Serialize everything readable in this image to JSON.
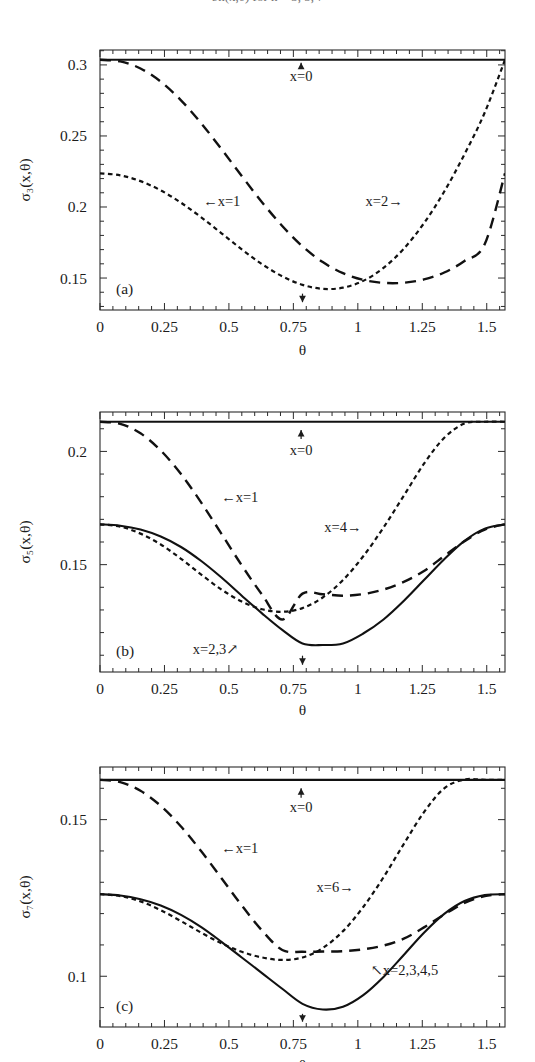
{
  "figure": {
    "partial_top_text": "σn(x,θ) for n = 3, 5, 7",
    "panel_count": 3
  },
  "panels": [
    {
      "tag": "(a)",
      "ylabel": "σ₃(x,θ)",
      "xlabel": "θ",
      "yticks": [
        "0.15",
        "0.2",
        "0.25",
        "0.3"
      ],
      "ytick_values": [
        0.15,
        0.2,
        0.25,
        0.3
      ],
      "xticks": [
        "0",
        "0.25",
        "0.5",
        "0.75",
        "1",
        "1.25",
        "1.5"
      ],
      "xtick_values": [
        0,
        0.25,
        0.5,
        0.75,
        1,
        1.25,
        1.5
      ],
      "annotations": [
        {
          "name": "x-zero-label",
          "text": "x=0",
          "arrow": "up"
        },
        {
          "name": "x-one-label",
          "text": "←x=1",
          "arrow": "none"
        },
        {
          "name": "x-two-label",
          "text": "x=2→",
          "arrow": "none"
        },
        {
          "name": "minimum-marker",
          "text": "",
          "arrow": "down"
        }
      ]
    },
    {
      "tag": "(b)",
      "ylabel": "σ₅(x,θ)",
      "xlabel": "θ",
      "yticks": [
        "0.15",
        "0.2"
      ],
      "ytick_values": [
        0.15,
        0.2
      ],
      "xticks": [
        "0",
        "0.25",
        "0.5",
        "0.75",
        "1",
        "1.25",
        "1.5"
      ],
      "xtick_values": [
        0,
        0.25,
        0.5,
        0.75,
        1,
        1.25,
        1.5
      ],
      "annotations": [
        {
          "name": "x-zero-label",
          "text": "x=0",
          "arrow": "up"
        },
        {
          "name": "x-one-label",
          "text": "←x=1",
          "arrow": "none"
        },
        {
          "name": "x-four-label",
          "text": "x=4→",
          "arrow": "none"
        },
        {
          "name": "x-two-three-label",
          "text": "x=2,3↗",
          "arrow": "none"
        },
        {
          "name": "minimum-marker",
          "text": "",
          "arrow": "down"
        }
      ]
    },
    {
      "tag": "(c)",
      "ylabel": "σ₇(x,θ)",
      "xlabel": "θ",
      "yticks": [
        "0.1",
        "0.15"
      ],
      "ytick_values": [
        0.1,
        0.15
      ],
      "xticks": [
        "0",
        "0.25",
        "0.5",
        "0.75",
        "1",
        "1.25",
        "1.5"
      ],
      "xtick_values": [
        0,
        0.25,
        0.5,
        0.75,
        1,
        1.25,
        1.5
      ],
      "annotations": [
        {
          "name": "x-zero-label",
          "text": "x=0",
          "arrow": "up"
        },
        {
          "name": "x-one-label",
          "text": "←x=1",
          "arrow": "none"
        },
        {
          "name": "x-six-label",
          "text": "x=6→",
          "arrow": "none"
        },
        {
          "name": "x-two-five-label",
          "text": "↖x=2,3,4,5",
          "arrow": "none"
        },
        {
          "name": "minimum-marker",
          "text": "",
          "arrow": "down"
        }
      ]
    }
  ],
  "chart_data": [
    {
      "type": "line",
      "panel": "(a)",
      "title": "",
      "xlabel": "θ",
      "ylabel": "σ₃(x,θ)",
      "xlim": [
        0,
        1.5708
      ],
      "ylim": [
        0.1275,
        0.3105
      ],
      "grid": false,
      "legend": "inline-annotations",
      "x": [
        0,
        0.0785,
        0.1571,
        0.2356,
        0.3142,
        0.3927,
        0.4712,
        0.5498,
        0.6283,
        0.7069,
        0.7854,
        0.8639,
        0.9425,
        1.021,
        1.0996,
        1.1781,
        1.2566,
        1.3352,
        1.4137,
        1.4923,
        1.5708
      ],
      "series": [
        {
          "name": "x=0",
          "style": "solid",
          "values": [
            0.3036,
            0.3036,
            0.3036,
            0.3036,
            0.3036,
            0.3036,
            0.3036,
            0.3036,
            0.3036,
            0.3036,
            0.3036,
            0.3036,
            0.3036,
            0.3036,
            0.3036,
            0.3036,
            0.3036,
            0.3036,
            0.3036,
            0.3036,
            0.3036
          ]
        },
        {
          "name": "x=1",
          "style": "dashed",
          "values": [
            0.3036,
            0.3025,
            0.2975,
            0.2882,
            0.2751,
            0.2589,
            0.2407,
            0.2218,
            0.2034,
            0.1866,
            0.1723,
            0.1612,
            0.1534,
            0.1487,
            0.1466,
            0.1467,
            0.149,
            0.1539,
            0.162,
            0.1739,
            0.2237
          ]
        },
        {
          "name": "x=2",
          "style": "dotted",
          "values": [
            0.2237,
            0.2223,
            0.2182,
            0.2117,
            0.203,
            0.1927,
            0.1815,
            0.1702,
            0.1598,
            0.1512,
            0.1452,
            0.1424,
            0.1432,
            0.148,
            0.1571,
            0.1706,
            0.1886,
            0.2109,
            0.2371,
            0.2665,
            0.3036
          ]
        }
      ]
    },
    {
      "type": "line",
      "panel": "(b)",
      "title": "",
      "xlabel": "θ",
      "ylabel": "σ₅(x,θ)",
      "xlim": [
        0,
        1.5708
      ],
      "ylim": [
        0.1026,
        0.2174
      ],
      "grid": false,
      "legend": "inline-annotations",
      "x": [
        0,
        0.0785,
        0.1571,
        0.2356,
        0.3142,
        0.3927,
        0.4712,
        0.5498,
        0.6283,
        0.7069,
        0.7854,
        0.8639,
        0.9425,
        1.021,
        1.0996,
        1.1781,
        1.2566,
        1.3352,
        1.4137,
        1.4923,
        1.5708
      ],
      "series": [
        {
          "name": "x=0",
          "style": "solid",
          "values": [
            0.2131,
            0.2131,
            0.2131,
            0.2131,
            0.2131,
            0.2131,
            0.2131,
            0.2131,
            0.2131,
            0.2131,
            0.2131,
            0.2131,
            0.2131,
            0.2131,
            0.2131,
            0.2131,
            0.2131,
            0.2131,
            0.2131,
            0.2131,
            0.2131
          ]
        },
        {
          "name": "x=1",
          "style": "dashed",
          "values": [
            0.2131,
            0.2122,
            0.208,
            0.2004,
            0.19,
            0.1774,
            0.1636,
            0.1497,
            0.1368,
            0.1258,
            0.1372,
            0.1369,
            0.1363,
            0.137,
            0.139,
            0.1424,
            0.1472,
            0.1538,
            0.1603,
            0.1655,
            0.1678
          ]
        },
        {
          "name": "x=2,3",
          "style": "solid",
          "values": [
            0.1678,
            0.1672,
            0.1655,
            0.1624,
            0.1578,
            0.1516,
            0.1443,
            0.1363,
            0.1285,
            0.1212,
            0.1152,
            0.1145,
            0.1152,
            0.1196,
            0.1258,
            0.134,
            0.1432,
            0.1524,
            0.1605,
            0.1659,
            0.1678
          ]
        },
        {
          "name": "x=4",
          "style": "dotted",
          "values": [
            0.1678,
            0.1668,
            0.1637,
            0.1589,
            0.1526,
            0.1456,
            0.139,
            0.1337,
            0.1303,
            0.1292,
            0.1308,
            0.1355,
            0.1432,
            0.1537,
            0.1664,
            0.1804,
            0.1946,
            0.206,
            0.2123,
            0.2131,
            0.2131
          ]
        }
      ]
    },
    {
      "type": "line",
      "panel": "(c)",
      "title": "",
      "xlabel": "θ",
      "ylabel": "σ₇(x,θ)",
      "xlim": [
        0,
        1.5708
      ],
      "ylim": [
        0.0838,
        0.1668
      ],
      "grid": false,
      "legend": "inline-annotations",
      "x": [
        0,
        0.0785,
        0.1571,
        0.2356,
        0.3142,
        0.3927,
        0.4712,
        0.5498,
        0.6283,
        0.7069,
        0.7854,
        0.8639,
        0.9425,
        1.021,
        1.0996,
        1.1781,
        1.2566,
        1.3352,
        1.4137,
        1.4923,
        1.5708
      ],
      "series": [
        {
          "name": "x=0",
          "style": "solid",
          "values": [
            0.1627,
            0.1627,
            0.1627,
            0.1627,
            0.1627,
            0.1627,
            0.1627,
            0.1627,
            0.1627,
            0.1627,
            0.1627,
            0.1627,
            0.1627,
            0.1627,
            0.1627,
            0.1627,
            0.1627,
            0.1627,
            0.1627,
            0.1627,
            0.1627
          ]
        },
        {
          "name": "x=1",
          "style": "dashed",
          "values": [
            0.1627,
            0.162,
            0.1592,
            0.1544,
            0.1478,
            0.1399,
            0.1313,
            0.1226,
            0.1146,
            0.1084,
            0.1078,
            0.1079,
            0.108,
            0.1086,
            0.1098,
            0.112,
            0.1156,
            0.1197,
            0.1234,
            0.1256,
            0.1262
          ]
        },
        {
          "name": "x=2,3,4,5",
          "style": "solid",
          "values": [
            0.1262,
            0.1258,
            0.1246,
            0.1226,
            0.1196,
            0.1157,
            0.111,
            0.106,
            0.101,
            0.096,
            0.0912,
            0.0894,
            0.0903,
            0.094,
            0.0998,
            0.1068,
            0.1139,
            0.1199,
            0.124,
            0.1259,
            0.1262
          ]
        },
        {
          "name": "x=6",
          "style": "dotted",
          "values": [
            0.1262,
            0.1256,
            0.1239,
            0.1211,
            0.1176,
            0.1139,
            0.1105,
            0.1078,
            0.106,
            0.1052,
            0.106,
            0.109,
            0.1144,
            0.1221,
            0.1316,
            0.1422,
            0.1524,
            0.16,
            0.1628,
            0.1627,
            0.1627
          ]
        }
      ]
    }
  ]
}
